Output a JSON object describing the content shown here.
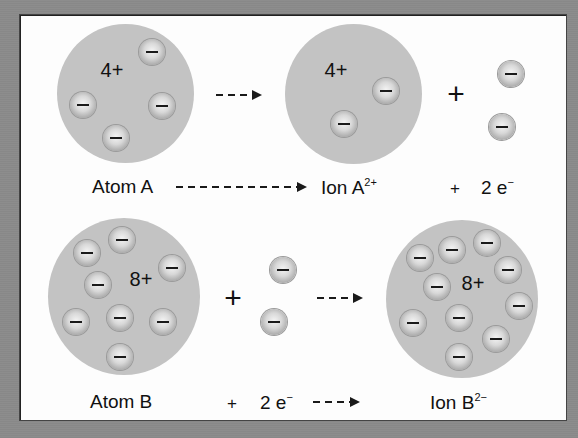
{
  "diagram": {
    "colors": {
      "frame": "#8b8b8b",
      "panel": "#fdfdfd",
      "atom_fill": "#c3c3c3",
      "text": "#111111"
    },
    "row_a": {
      "atom": {
        "charge_label": "4+",
        "electron_count": 4,
        "name_label": "Atom A"
      },
      "ion": {
        "charge_label": "4+",
        "electron_count": 2,
        "name_label": "Ion A",
        "superscript": "2+"
      },
      "plus_symbol": "+",
      "released_electrons": {
        "count": 2,
        "label_plus": "+",
        "label_text": "2 e",
        "label_superscript": "−"
      },
      "equation": "Atom A ----------> Ion A2+ + 2 e−"
    },
    "row_b": {
      "atom": {
        "charge_label": "8+",
        "electron_count": 8,
        "name_label": "Atom B"
      },
      "ion": {
        "charge_label": "8+",
        "electron_count": 10,
        "name_label": "Ion B",
        "superscript": "2−"
      },
      "plus_symbol": "+",
      "gained_electrons": {
        "count": 2,
        "label_plus": "+",
        "label_text": "2 e",
        "label_superscript": "−"
      },
      "equation": "Atom B + 2 e− ---> Ion B2−"
    }
  }
}
